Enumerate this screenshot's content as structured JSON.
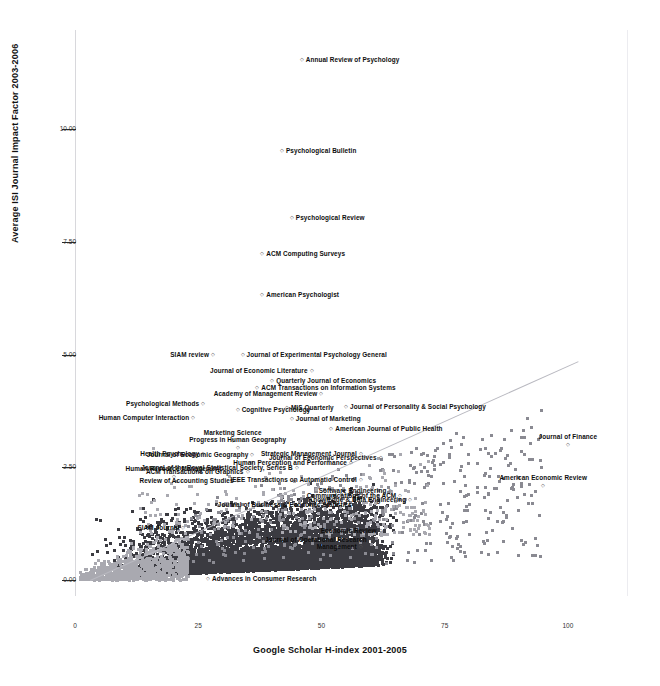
{
  "chart_data": {
    "type": "scatter",
    "title": "",
    "xlabel": "Google Scholar H-index 2001-2005",
    "ylabel": "Average ISI Journal Impact Factor 2003-2006",
    "xlim": [
      0,
      112
    ],
    "ylim": [
      -0.35,
      12.2
    ],
    "xticks": [
      0,
      25,
      50,
      75,
      100
    ],
    "xtick_labels": [
      "0",
      "25",
      "50",
      "75",
      "100"
    ],
    "yticks": [
      0.0,
      2.5,
      5.0,
      7.5,
      10.0
    ],
    "ytick_labels": [
      "0.00",
      "2.50",
      "5.00",
      "7.50",
      "10.00"
    ],
    "grid": false,
    "legend": null,
    "trendline": {
      "visible": true,
      "x0": 3,
      "y0": 0.0,
      "x1": 102,
      "y1": 4.85,
      "color": "#b9b9c0"
    },
    "marker_color": "#8a8a92",
    "labeled_points": [
      {
        "label": "Annual Review of Psychology",
        "x": 46,
        "y": 11.55
      },
      {
        "label": "Psychological Bulletin",
        "x": 42,
        "y": 9.55
      },
      {
        "label": "Psychological Review",
        "x": 44,
        "y": 8.05
      },
      {
        "label": "ACM Computing Surveys",
        "x": 38,
        "y": 7.25
      },
      {
        "label": "American Psychologist",
        "x": 38,
        "y": 6.35
      },
      {
        "label": "SIAM review",
        "x": 28,
        "y": 5.02
      },
      {
        "label": "Journal of Experimental Psychology General",
        "x": 34,
        "y": 5.02
      },
      {
        "label": "Journal of Economic Literature",
        "x": 48,
        "y": 4.66
      },
      {
        "label": "Quarterly Journal of Economics",
        "x": 40,
        "y": 4.45
      },
      {
        "label": "ACM Transactions on Information Systems",
        "x": 37,
        "y": 4.28
      },
      {
        "label": "Academy of Management Review",
        "x": 50,
        "y": 4.16
      },
      {
        "label": "Psychological Methods",
        "x": 26,
        "y": 3.92
      },
      {
        "label": "Cognitive Psychology",
        "x": 33,
        "y": 3.8
      },
      {
        "label": "MIS Quarterly",
        "x": 43,
        "y": 3.83
      },
      {
        "label": "Journal of Personality & Social Psychology",
        "x": 55,
        "y": 3.86
      },
      {
        "label": "Human Computer Interaction",
        "x": 24,
        "y": 3.62
      },
      {
        "label": "Journal of Marketing",
        "x": 44,
        "y": 3.6
      },
      {
        "label": "American Journal of Public Health",
        "x": 52,
        "y": 3.38
      },
      {
        "label": "Marketing Science",
        "x": 32,
        "y": 3.12
      },
      {
        "label": "Progress in Human Geography",
        "x": 33,
        "y": 2.96
      },
      {
        "label": "Health Psychology",
        "x": 26,
        "y": 2.82
      },
      {
        "label": "Journal of Economic Geography",
        "x": 36,
        "y": 2.8
      },
      {
        "label": "Journal of Economic Perspectives",
        "x": 62,
        "y": 2.74
      },
      {
        "label": "Strategic Management Journal",
        "x": 58,
        "y": 2.83
      },
      {
        "label": "Journal of Finance",
        "x": 100,
        "y": 3.02
      },
      {
        "label": "Human Perception and Performance",
        "x": 56,
        "y": 2.62
      },
      {
        "label": "Journal of the Royal Statistical Society, Series B",
        "x": 45,
        "y": 2.5
      },
      {
        "label": "ACM Transactions on Graphics",
        "x": 35,
        "y": 2.42
      },
      {
        "label": "Human Resource Management",
        "x": 20,
        "y": 2.3
      },
      {
        "label": "Review of Accounting Studies",
        "x": 33,
        "y": 2.22
      },
      {
        "label": "IEEE Transactions on Automatic Control",
        "x": 58,
        "y": 2.24
      },
      {
        "label": "American Economic Review",
        "x": 95,
        "y": 2.12
      },
      {
        "label": "Software Engineering",
        "x": 64,
        "y": 2.0
      },
      {
        "label": "Communications of the ACM",
        "x": 66,
        "y": 1.88
      },
      {
        "label": "Knowledge & Data Engineering",
        "x": 68,
        "y": 1.8
      },
      {
        "label": "Journal of Business & Economic Statistics",
        "x": 57,
        "y": 1.7
      },
      {
        "label": "SIAM Journal",
        "x": 22,
        "y": 1.18
      },
      {
        "label": "Economic Review",
        "x": 62,
        "y": 1.12
      },
      {
        "label": "Journal of Operational Research",
        "x": 60,
        "y": 0.92
      },
      {
        "label": "Management",
        "x": 58,
        "y": 0.76
      },
      {
        "label": "Advances in Consumer Research",
        "x": 27,
        "y": 0.04
      }
    ]
  },
  "axes": {
    "y_title": "Average ISI Journal Impact Factor 2003-2006",
    "x_title": "Google Scholar H-index 2001-2005",
    "y_ticks": [
      "10.00",
      "7.50",
      "5.00",
      "2.50",
      "0.00"
    ],
    "x_ticks": [
      "0",
      "25",
      "50",
      "75",
      "100"
    ]
  }
}
